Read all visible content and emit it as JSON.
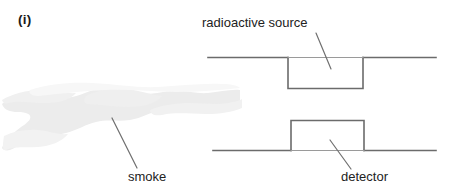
{
  "figure": {
    "part_label": "(i)",
    "background_color": "#ffffff",
    "width": 450,
    "height": 196
  },
  "labels": {
    "source": "radioactive source",
    "smoke": "smoke",
    "detector": "detector"
  },
  "colors": {
    "line": "#6b6b6b",
    "text": "#222222",
    "smoke_fill": "#ececec",
    "smoke_fill_light": "#f3f3f3",
    "leader": "#707070"
  },
  "elements": {
    "source_housing": {
      "name": "radioactive source housing",
      "shape": "rectangle below horizontal line",
      "x": 288,
      "y": 57,
      "width": 75,
      "height": 31
    },
    "detector_housing": {
      "name": "detector housing",
      "shape": "rectangle above horizontal line",
      "x": 291,
      "y": 120,
      "width": 73,
      "height": 30
    },
    "upper_plate": {
      "name": "upper horizontal plate",
      "x1": 208,
      "y1": 57,
      "x2": 436,
      "y2": 57
    },
    "lower_plate": {
      "name": "lower horizontal plate",
      "x1": 213,
      "y1": 150,
      "x2": 436,
      "y2": 150
    },
    "smoke_cloud": {
      "name": "smoke cloud",
      "x": 0,
      "y": 88,
      "width": 240,
      "height": 75
    }
  },
  "leader_lines": {
    "source": {
      "x1": 316,
      "y1": 33,
      "x2": 331,
      "y2": 69
    },
    "smoke": {
      "x1": 112,
      "y1": 118,
      "x2": 137,
      "y2": 168
    },
    "detector": {
      "x1": 330,
      "y1": 140,
      "x2": 351,
      "y2": 169
    }
  }
}
